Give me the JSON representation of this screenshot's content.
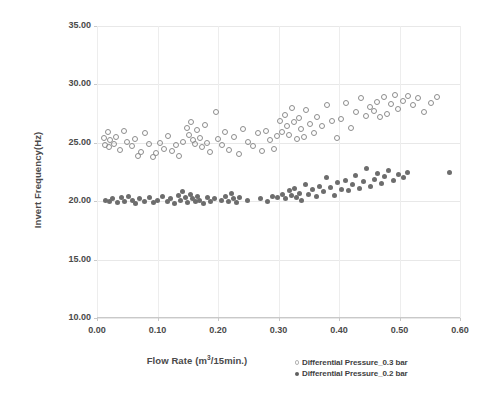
{
  "chart_data": {
    "type": "scatter",
    "title": "",
    "xlabel": "Flow Rate (m³/15min.)",
    "ylabel": "Invert Frequency(Hz)",
    "xlim": [
      0.0,
      0.6
    ],
    "ylim": [
      10.0,
      35.0
    ],
    "xticks": [
      "0.00",
      "0.10",
      "0.20",
      "0.30",
      "0.40",
      "0.50",
      "0.60"
    ],
    "xtick_values": [
      0.0,
      0.1,
      0.2,
      0.3,
      0.4,
      0.5,
      0.6
    ],
    "yticks": [
      "10.00",
      "15.00",
      "20.00",
      "25.00",
      "30.00",
      "35.00"
    ],
    "ytick_values": [
      10,
      15,
      20,
      25,
      30,
      35
    ],
    "grid": true,
    "legend_position": "bottom-right",
    "series": [
      {
        "name": "Differential Pressure_0.3 bar",
        "marker": "open-circle",
        "color": "#8d8d8d",
        "points": [
          [
            0.012,
            25.4
          ],
          [
            0.013,
            24.8
          ],
          [
            0.018,
            25.9
          ],
          [
            0.02,
            24.6
          ],
          [
            0.022,
            25.2
          ],
          [
            0.028,
            24.9
          ],
          [
            0.032,
            25.5
          ],
          [
            0.038,
            24.4
          ],
          [
            0.045,
            26.0
          ],
          [
            0.05,
            25.1
          ],
          [
            0.058,
            24.7
          ],
          [
            0.062,
            25.3
          ],
          [
            0.068,
            23.9
          ],
          [
            0.072,
            24.2
          ],
          [
            0.08,
            25.8
          ],
          [
            0.086,
            24.9
          ],
          [
            0.092,
            23.8
          ],
          [
            0.098,
            24.1
          ],
          [
            0.104,
            25.0
          ],
          [
            0.11,
            24.5
          ],
          [
            0.118,
            25.6
          ],
          [
            0.124,
            24.3
          ],
          [
            0.13,
            24.8
          ],
          [
            0.136,
            23.9
          ],
          [
            0.142,
            25.1
          ],
          [
            0.148,
            26.3
          ],
          [
            0.152,
            25.7
          ],
          [
            0.156,
            26.8
          ],
          [
            0.158,
            25.2
          ],
          [
            0.162,
            24.9
          ],
          [
            0.166,
            26.1
          ],
          [
            0.17,
            25.4
          ],
          [
            0.174,
            24.6
          ],
          [
            0.178,
            26.5
          ],
          [
            0.182,
            25.0
          ],
          [
            0.186,
            24.2
          ],
          [
            0.196,
            27.6
          ],
          [
            0.2,
            25.3
          ],
          [
            0.206,
            24.8
          ],
          [
            0.212,
            25.9
          ],
          [
            0.218,
            24.4
          ],
          [
            0.226,
            25.5
          ],
          [
            0.234,
            24.0
          ],
          [
            0.242,
            26.2
          ],
          [
            0.25,
            25.1
          ],
          [
            0.258,
            24.7
          ],
          [
            0.266,
            25.8
          ],
          [
            0.272,
            24.3
          ],
          [
            0.28,
            26.0
          ],
          [
            0.286,
            25.2
          ],
          [
            0.292,
            24.5
          ],
          [
            0.298,
            25.6
          ],
          [
            0.302,
            26.9
          ],
          [
            0.306,
            25.9
          ],
          [
            0.31,
            27.4
          ],
          [
            0.314,
            26.4
          ],
          [
            0.318,
            25.7
          ],
          [
            0.322,
            28.0
          ],
          [
            0.326,
            26.8
          ],
          [
            0.33,
            25.3
          ],
          [
            0.334,
            27.1
          ],
          [
            0.338,
            26.2
          ],
          [
            0.342,
            25.5
          ],
          [
            0.346,
            27.8
          ],
          [
            0.352,
            26.6
          ],
          [
            0.358,
            25.8
          ],
          [
            0.364,
            27.2
          ],
          [
            0.372,
            26.4
          ],
          [
            0.38,
            28.2
          ],
          [
            0.388,
            26.9
          ],
          [
            0.396,
            25.4
          ],
          [
            0.404,
            27.0
          ],
          [
            0.412,
            28.4
          ],
          [
            0.42,
            26.3
          ],
          [
            0.428,
            27.6
          ],
          [
            0.436,
            28.8
          ],
          [
            0.444,
            27.3
          ],
          [
            0.452,
            28.1
          ],
          [
            0.458,
            27.7
          ],
          [
            0.462,
            28.5
          ],
          [
            0.468,
            27.2
          ],
          [
            0.474,
            28.9
          ],
          [
            0.48,
            27.5
          ],
          [
            0.486,
            28.3
          ],
          [
            0.492,
            29.1
          ],
          [
            0.498,
            27.9
          ],
          [
            0.506,
            28.6
          ],
          [
            0.514,
            29.0
          ],
          [
            0.522,
            28.2
          ],
          [
            0.53,
            28.8
          ],
          [
            0.54,
            27.6
          ],
          [
            0.552,
            28.4
          ],
          [
            0.562,
            28.9
          ]
        ]
      },
      {
        "name": "Differential Pressure_0.2 bar",
        "marker": "filled-circle",
        "color": "#6d6d6d",
        "points": [
          [
            0.014,
            20.1
          ],
          [
            0.02,
            20.0
          ],
          [
            0.026,
            20.2
          ],
          [
            0.034,
            19.9
          ],
          [
            0.04,
            20.3
          ],
          [
            0.046,
            20.0
          ],
          [
            0.052,
            20.4
          ],
          [
            0.058,
            20.1
          ],
          [
            0.064,
            19.8
          ],
          [
            0.07,
            20.2
          ],
          [
            0.078,
            20.0
          ],
          [
            0.086,
            20.3
          ],
          [
            0.094,
            19.9
          ],
          [
            0.1,
            20.1
          ],
          [
            0.108,
            20.4
          ],
          [
            0.116,
            20.0
          ],
          [
            0.122,
            20.2
          ],
          [
            0.128,
            19.8
          ],
          [
            0.134,
            20.5
          ],
          [
            0.138,
            20.1
          ],
          [
            0.142,
            20.8
          ],
          [
            0.146,
            20.3
          ],
          [
            0.15,
            19.9
          ],
          [
            0.154,
            20.6
          ],
          [
            0.158,
            20.2
          ],
          [
            0.162,
            20.0
          ],
          [
            0.166,
            20.4
          ],
          [
            0.17,
            20.1
          ],
          [
            0.176,
            19.8
          ],
          [
            0.182,
            20.3
          ],
          [
            0.188,
            20.0
          ],
          [
            0.194,
            20.2
          ],
          [
            0.206,
            20.1
          ],
          [
            0.212,
            20.4
          ],
          [
            0.218,
            20.0
          ],
          [
            0.222,
            20.7
          ],
          [
            0.226,
            20.2
          ],
          [
            0.23,
            19.9
          ],
          [
            0.236,
            20.3
          ],
          [
            0.248,
            20.1
          ],
          [
            0.27,
            20.2
          ],
          [
            0.282,
            20.0
          ],
          [
            0.29,
            20.4
          ],
          [
            0.298,
            20.3
          ],
          [
            0.306,
            20.6
          ],
          [
            0.312,
            20.2
          ],
          [
            0.318,
            20.9
          ],
          [
            0.322,
            20.5
          ],
          [
            0.326,
            21.1
          ],
          [
            0.33,
            20.3
          ],
          [
            0.334,
            20.7
          ],
          [
            0.338,
            20.1
          ],
          [
            0.344,
            21.4
          ],
          [
            0.35,
            20.6
          ],
          [
            0.356,
            21.0
          ],
          [
            0.362,
            20.4
          ],
          [
            0.368,
            21.3
          ],
          [
            0.374,
            20.8
          ],
          [
            0.38,
            22.0
          ],
          [
            0.386,
            21.2
          ],
          [
            0.392,
            20.5
          ],
          [
            0.398,
            21.6
          ],
          [
            0.404,
            21.0
          ],
          [
            0.41,
            21.8
          ],
          [
            0.416,
            20.9
          ],
          [
            0.422,
            21.4
          ],
          [
            0.428,
            22.2
          ],
          [
            0.434,
            21.1
          ],
          [
            0.44,
            21.7
          ],
          [
            0.446,
            22.8
          ],
          [
            0.452,
            21.3
          ],
          [
            0.458,
            21.9
          ],
          [
            0.464,
            22.4
          ],
          [
            0.47,
            21.5
          ],
          [
            0.476,
            22.1
          ],
          [
            0.482,
            22.6
          ],
          [
            0.49,
            21.8
          ],
          [
            0.498,
            22.3
          ],
          [
            0.506,
            22.0
          ],
          [
            0.514,
            22.5
          ],
          [
            0.582,
            22.5
          ]
        ]
      }
    ]
  },
  "legend": {
    "items": [
      {
        "label": "Differential Pressure_0.3 bar",
        "marker": "open-circle"
      },
      {
        "label": "Differential Pressure_0.2 bar",
        "marker": "filled-circle"
      }
    ]
  },
  "axis_titles": {
    "x_prefix": "Flow Rate (m",
    "x_sup": "3",
    "x_suffix": "/15min.)",
    "y": "Invert Frequency(Hz)"
  }
}
